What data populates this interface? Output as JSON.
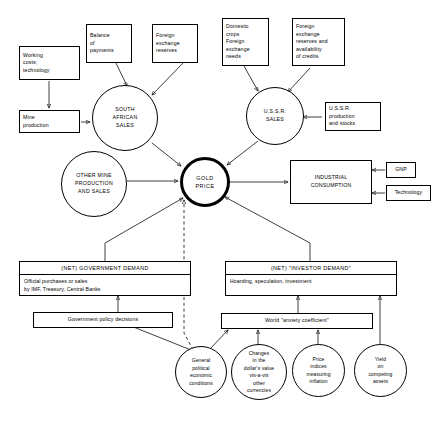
{
  "diagram": {
    "nodes": {
      "working_costs": "Working\ncosts;\ntechnology",
      "mine_production": "Mine\nproduction",
      "balance_of_payments": "Balance\nof\npayments",
      "foreign_exchange_reserves": "Foreign\nexchange\nreserves",
      "south_african_sales": "SOUTH\nAFRICAN\nSALES",
      "domestic_crops": "Domestic\ncrops\nForeign\nexchange\nneeds",
      "fx_reserves_credits": "Foreign\nexchange\nreserves and\navailability\nof credits",
      "ussr_sales": "U.S.S.R.\nSALES",
      "ussr_production": "U.S.S.R.\nproduction\nand stocks",
      "other_mine": "OTHER MINE\nPRODUCTION\nAND SALES",
      "gold_price": "GOLD\nPRICE",
      "industrial_consumption": "INDUSTRIAL\nCONSUMPTION",
      "gnp": "GNP",
      "technology": "Technology",
      "government_demand_title": "(NET) GOVERNMENT DEMAND",
      "government_demand_body": "Official purchases or sales\nby IMF, Treasury, Central Banks",
      "investor_demand_title": "(NET) \"INVESTOR DEMAND\"",
      "investor_demand_body": "Hoarding, speculation, investment",
      "government_policy": "Government policy decisions",
      "anxiety_coefficient": "World \"anxiety coefficient\"",
      "general_conditions": "General\npolitical\neconomic\nconditions",
      "dollar_value": "Changes\nin the\ndollar's value\nvis-a-vis\nother\ncurrencies",
      "price_indices": "Price\nindices\nmeasuring\ninflation",
      "competing_yield": "Yield\non\ncompeting\nassets"
    },
    "colors": {
      "stroke": "#000000",
      "background": "#ffffff"
    }
  }
}
